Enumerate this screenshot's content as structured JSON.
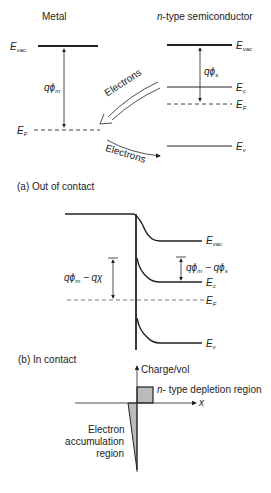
{
  "panel_a": {
    "metal_title": "Metal",
    "semi_title_italic": "n",
    "semi_title_rest": "-type semiconductor",
    "metal_levels": {
      "e_vac": "E",
      "e_vac_sub": "vac",
      "e_f": "E",
      "e_f_sub": "F"
    },
    "metal_workfunction": {
      "q": "q",
      "phi": "ϕ",
      "sub": "m"
    },
    "semi_levels": {
      "e_vac": "E",
      "e_vac_sub": "vac",
      "e_c": "E",
      "e_c_sub": "c",
      "e_f": "E",
      "e_f_sub": "F",
      "e_v": "E",
      "e_v_sub": "v"
    },
    "semi_workfunction": {
      "q": "q",
      "phi": "ϕ",
      "sub": "s"
    },
    "arrow_upper_label": "Electrons",
    "arrow_lower_label": "Electrons",
    "caption": "(a) Out of contact"
  },
  "panel_b": {
    "levels": {
      "e_vac": "E",
      "e_vac_sub": "vac",
      "e_c": "E",
      "e_c_sub": "c",
      "e_f": "E",
      "e_f_sub": "F",
      "e_v": "E",
      "e_v_sub": "v"
    },
    "left_gap": {
      "q1": "qϕ",
      "sub1": "m",
      "mid": " − qχ"
    },
    "right_gap": {
      "q1": "qϕ",
      "sub1": "m",
      "mid": " − qϕ",
      "sub2": "s"
    },
    "caption": "(b) In contact"
  },
  "panel_c": {
    "y_axis_label": "Charge/vol",
    "x_axis_label": "x",
    "depletion_label_italic": "n",
    "depletion_label_rest": "- type depletion region",
    "accumulation_label": [
      "Electron",
      "accumulation",
      "region"
    ]
  },
  "colors": {
    "line": "#222222",
    "dashed": "#555555",
    "fill": "#bbbbbb"
  }
}
